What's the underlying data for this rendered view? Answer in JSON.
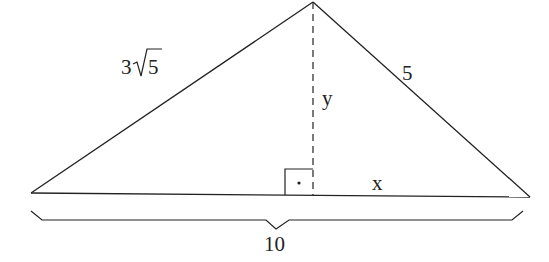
{
  "figure": {
    "type": "triangle-with-altitude",
    "labels": {
      "left_side": "3√5",
      "left_side_coef": "3",
      "left_side_radicand": "5",
      "right_side": "5",
      "altitude": "y",
      "right_base_segment": "x",
      "base_total": "10"
    },
    "right_angle_marker": "•",
    "colors": {
      "stroke": "#222222",
      "background": "#ffffff"
    }
  }
}
